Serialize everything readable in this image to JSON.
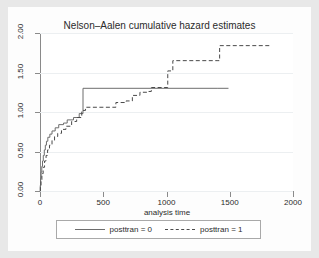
{
  "chart_data": {
    "type": "line",
    "title": "Nelson–Aalen cumulative hazard estimates",
    "xlabel": "analysis time",
    "ylabel": "",
    "xlim": [
      0,
      2000
    ],
    "ylim": [
      0,
      2.0
    ],
    "grid": true,
    "legend_position": "bottom",
    "x_ticks": [
      0,
      500,
      1000,
      1500,
      2000
    ],
    "x_tick_labels": [
      "0",
      "500",
      "1000",
      "1500",
      "2000"
    ],
    "y_ticks": [
      0.0,
      0.5,
      1.0,
      1.5,
      2.0
    ],
    "y_tick_labels": [
      "0.00",
      "0.50",
      "1.00",
      "1.50",
      "2.00"
    ],
    "series": [
      {
        "name": "posttran = 0",
        "style": "solid",
        "color": "#6d6d6d",
        "step": "post",
        "points": [
          [
            0,
            0.0
          ],
          [
            2,
            0.07
          ],
          [
            5,
            0.16
          ],
          [
            9,
            0.24
          ],
          [
            14,
            0.31
          ],
          [
            20,
            0.38
          ],
          [
            26,
            0.45
          ],
          [
            34,
            0.52
          ],
          [
            42,
            0.58
          ],
          [
            51,
            0.63
          ],
          [
            62,
            0.68
          ],
          [
            78,
            0.72
          ],
          [
            95,
            0.76
          ],
          [
            120,
            0.8
          ],
          [
            148,
            0.84
          ],
          [
            186,
            0.86
          ],
          [
            215,
            0.9
          ],
          [
            265,
            0.93
          ],
          [
            310,
            0.98
          ],
          [
            340,
            1.3
          ],
          [
            1400,
            1.3
          ],
          [
            1490,
            1.3
          ]
        ]
      },
      {
        "name": "posttran = 1",
        "style": "dashed",
        "color": "#4a4a4a",
        "step": "post",
        "points": [
          [
            1,
            0.0
          ],
          [
            3,
            0.06
          ],
          [
            8,
            0.14
          ],
          [
            15,
            0.22
          ],
          [
            25,
            0.3
          ],
          [
            36,
            0.38
          ],
          [
            48,
            0.45
          ],
          [
            60,
            0.52
          ],
          [
            75,
            0.58
          ],
          [
            95,
            0.64
          ],
          [
            115,
            0.69
          ],
          [
            140,
            0.73
          ],
          [
            170,
            0.78
          ],
          [
            205,
            0.82
          ],
          [
            250,
            0.88
          ],
          [
            290,
            0.93
          ],
          [
            330,
            1.02
          ],
          [
            360,
            1.06
          ],
          [
            560,
            1.06
          ],
          [
            600,
            1.12
          ],
          [
            680,
            1.14
          ],
          [
            730,
            1.21
          ],
          [
            790,
            1.25
          ],
          [
            850,
            1.26
          ],
          [
            880,
            1.31
          ],
          [
            980,
            1.31
          ],
          [
            1010,
            1.52
          ],
          [
            1050,
            1.65
          ],
          [
            1400,
            1.65
          ],
          [
            1420,
            1.84
          ],
          [
            1830,
            1.84
          ]
        ]
      }
    ]
  },
  "legend": {
    "entries": [
      {
        "label": "posttran = 0",
        "style": "solid"
      },
      {
        "label": "posttran = 1",
        "style": "dashed"
      }
    ]
  }
}
